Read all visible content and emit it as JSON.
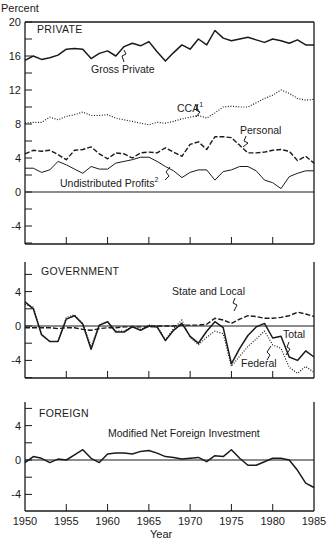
{
  "chart_data": [
    {
      "type": "line",
      "title": "PRIVATE",
      "ylabel": "Percent",
      "xlabel": "",
      "xlim": [
        1950,
        1985
      ],
      "ylim": [
        -6,
        20
      ],
      "yticks": [
        -4,
        0,
        4,
        8,
        12,
        16,
        20
      ],
      "ytick_labels": [
        "-4",
        "0",
        "4",
        "8",
        "12",
        "16",
        "20"
      ],
      "x": [
        1950,
        1951,
        1952,
        1953,
        1954,
        1955,
        1956,
        1957,
        1958,
        1959,
        1960,
        1961,
        1962,
        1963,
        1964,
        1965,
        1966,
        1967,
        1968,
        1969,
        1970,
        1971,
        1972,
        1973,
        1974,
        1975,
        1976,
        1977,
        1978,
        1979,
        1980,
        1981,
        1982,
        1983,
        1984,
        1985
      ],
      "series": [
        {
          "name": "Gross Private",
          "style": "solid",
          "annotation": "Gross Private",
          "values": [
            15.5,
            16.0,
            15.6,
            15.8,
            16.1,
            16.8,
            16.9,
            16.8,
            15.7,
            16.3,
            16.6,
            16.0,
            17.1,
            17.5,
            17.2,
            17.7,
            16.5,
            15.4,
            16.4,
            17.3,
            16.8,
            18.0,
            17.3,
            19.0,
            18.1,
            17.8,
            18.0,
            18.2,
            17.9,
            17.6,
            18.0,
            17.8,
            17.5,
            17.9,
            17.3,
            17.3
          ]
        },
        {
          "name": "CCA",
          "style": "dotted",
          "annotation": "CCA",
          "annotation_sup": "1",
          "values": [
            8.1,
            8.2,
            8.2,
            8.8,
            8.5,
            8.9,
            9.1,
            9.4,
            9.0,
            9.0,
            9.1,
            8.7,
            8.5,
            8.3,
            8.1,
            7.9,
            8.2,
            8.1,
            8.3,
            8.6,
            8.8,
            9.0,
            8.7,
            9.3,
            10.0,
            10.1,
            10.0,
            10.0,
            10.5,
            11.0,
            11.4,
            12.0,
            11.6,
            11.0,
            10.8,
            10.9
          ]
        },
        {
          "name": "Personal",
          "style": "dashed",
          "annotation": "Personal",
          "values": [
            4.5,
            4.9,
            4.8,
            4.9,
            4.4,
            3.8,
            4.9,
            5.0,
            5.3,
            4.5,
            3.9,
            4.6,
            4.5,
            4.0,
            4.6,
            4.7,
            4.6,
            5.2,
            4.7,
            4.2,
            5.6,
            5.9,
            5.0,
            6.5,
            6.5,
            6.4,
            5.5,
            4.6,
            4.6,
            4.7,
            4.9,
            5.0,
            4.8,
            3.7,
            4.2,
            3.4
          ]
        },
        {
          "name": "Undistributed Profits",
          "style": "solid-thin",
          "annotation": "Undistributed Profits",
          "annotation_sup": "2",
          "values": [
            2.8,
            2.8,
            2.3,
            2.6,
            3.6,
            3.2,
            2.7,
            2.2,
            3.0,
            2.7,
            2.7,
            3.4,
            3.6,
            3.8,
            4.1,
            4.1,
            3.6,
            3.0,
            2.5,
            1.7,
            2.3,
            2.6,
            2.6,
            1.4,
            2.4,
            2.6,
            3.0,
            3.0,
            2.5,
            1.4,
            1.1,
            0.4,
            1.8,
            2.2,
            2.5,
            2.5
          ]
        }
      ],
      "annotations": [
        "Gross Private",
        "CCA",
        "Personal",
        "Undistributed Profits"
      ]
    },
    {
      "type": "line",
      "title": "GOVERNMENT",
      "xlim": [
        1950,
        1985
      ],
      "ylim": [
        -6,
        7
      ],
      "yticks": [
        -4,
        0,
        4
      ],
      "ytick_labels": [
        "-4",
        "0",
        "4"
      ],
      "x": [
        1950,
        1951,
        1952,
        1953,
        1954,
        1955,
        1956,
        1957,
        1958,
        1959,
        1960,
        1961,
        1962,
        1963,
        1964,
        1965,
        1966,
        1967,
        1968,
        1969,
        1970,
        1971,
        1972,
        1973,
        1974,
        1975,
        1976,
        1977,
        1978,
        1979,
        1980,
        1981,
        1982,
        1983,
        1984,
        1985
      ],
      "series": [
        {
          "name": "State and Local",
          "style": "dashed",
          "annotation": "State and Local",
          "values": [
            -0.2,
            -0.2,
            -0.2,
            -0.2,
            -0.3,
            -0.2,
            -0.2,
            -0.4,
            -0.5,
            -0.3,
            -0.2,
            -0.2,
            -0.1,
            -0.1,
            -0.1,
            -0.1,
            0.0,
            0.0,
            0.0,
            0.1,
            0.1,
            0.1,
            0.2,
            0.9,
            0.7,
            0.3,
            0.8,
            1.2,
            1.1,
            0.9,
            0.9,
            1.0,
            1.2,
            1.6,
            1.4,
            1.1
          ]
        },
        {
          "name": "Total",
          "style": "solid",
          "annotation": "Total",
          "values": [
            2.8,
            2.0,
            -1.0,
            -1.8,
            -1.8,
            0.8,
            1.2,
            0.2,
            -2.7,
            0.1,
            0.5,
            -0.7,
            -0.7,
            -0.1,
            -0.5,
            0.0,
            -0.1,
            -1.7,
            -0.5,
            0.3,
            -1.2,
            -2.0,
            -0.6,
            0.5,
            -0.2,
            -4.4,
            -2.6,
            -1.1,
            -0.1,
            0.3,
            -1.4,
            -1.2,
            -3.6,
            -4.0,
            -2.9,
            -3.6
          ]
        },
        {
          "name": "Federal",
          "style": "dotted",
          "annotation": "Federal",
          "values": [
            2.5,
            2.2,
            -1.0,
            -1.8,
            -1.8,
            1.0,
            1.3,
            0.3,
            -2.4,
            0.1,
            0.5,
            -0.6,
            -0.6,
            0.0,
            -0.4,
            0.1,
            0.0,
            -1.6,
            -0.3,
            0.7,
            -1.3,
            -2.2,
            -1.3,
            -0.6,
            -0.9,
            -4.7,
            -3.5,
            -2.4,
            -1.5,
            -0.6,
            -2.2,
            -2.6,
            -4.8,
            -5.5,
            -4.7,
            -5.4
          ]
        }
      ],
      "annotations": [
        "State and Local",
        "Total",
        "Federal"
      ]
    },
    {
      "type": "line",
      "title": "FOREIGN",
      "xlabel": "Year",
      "xlim": [
        1950,
        1985
      ],
      "ylim": [
        -6,
        7
      ],
      "yticks": [
        -4,
        0,
        4
      ],
      "ytick_labels": [
        "-4",
        "0",
        "4"
      ],
      "xticks": [
        1950,
        1955,
        1960,
        1965,
        1970,
        1975,
        1980,
        1985
      ],
      "xtick_labels": [
        "1950",
        "1955",
        "1960",
        "1965",
        "1970",
        "1975",
        "1980",
        "1985"
      ],
      "x": [
        1950,
        1951,
        1952,
        1953,
        1954,
        1955,
        1956,
        1957,
        1958,
        1959,
        1960,
        1961,
        1962,
        1963,
        1964,
        1965,
        1966,
        1967,
        1968,
        1969,
        1970,
        1971,
        1972,
        1973,
        1974,
        1975,
        1976,
        1977,
        1978,
        1979,
        1980,
        1981,
        1982,
        1983,
        1984,
        1985
      ],
      "series": [
        {
          "name": "Modified Net Foreign Investment",
          "style": "solid",
          "annotation": "Modified Net Foreign Investment",
          "values": [
            -0.3,
            0.4,
            0.2,
            -0.3,
            0.1,
            0.0,
            0.6,
            1.2,
            0.2,
            -0.3,
            0.7,
            0.8,
            0.8,
            0.7,
            1.0,
            1.1,
            0.8,
            0.4,
            0.3,
            0.1,
            0.2,
            0.3,
            -0.2,
            0.5,
            0.4,
            1.2,
            0.2,
            -0.6,
            -0.6,
            -0.2,
            0.2,
            0.2,
            0.0,
            -1.2,
            -2.7,
            -3.2
          ]
        }
      ],
      "annotations": [
        "Modified Net Foreign Investment"
      ]
    }
  ],
  "labels": {
    "ylabel": "Percent",
    "xlabel": "Year",
    "private_title": "PRIVATE",
    "government_title": "GOVERNMENT",
    "foreign_title": "FOREIGN",
    "gross_private": "Gross Private",
    "cca": "CCA",
    "cca_sup": "1",
    "personal": "Personal",
    "undistributed": "Undistributed Profits",
    "undistributed_sup": "2",
    "state_local": "State and Local",
    "total": "Total",
    "federal": "Federal",
    "mnfi": "Modified Net Foreign Investment"
  }
}
